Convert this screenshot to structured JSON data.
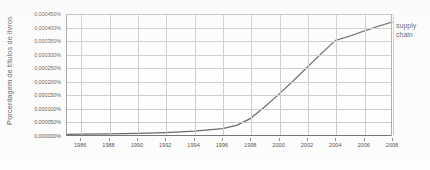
{
  "chart_data": {
    "type": "line",
    "title": "",
    "xlabel": "",
    "ylabel": "Porcentagem de títulos de livros",
    "xlim": [
      1985,
      2008
    ],
    "ylim": [
      0,
      0.00045
    ],
    "grid": true,
    "legend_position": "right-end-of-line",
    "y_tick_labels": [
      "0,000450%",
      "0,000400%",
      "0,000350%",
      "0,000300%",
      "0,000250%",
      "0,000200%",
      "0,000150%",
      "0,000100%",
      "0,000050%",
      "0,000000%"
    ],
    "y_tick_values": [
      0.00045,
      0.0004,
      0.00035,
      0.0003,
      0.00025,
      0.0002,
      0.00015,
      0.0001,
      5e-05,
      0
    ],
    "x_tick_labels": [
      "1986",
      "1988",
      "1990",
      "1992",
      "1994",
      "1996",
      "1998",
      "2000",
      "2002",
      "2004",
      "2006",
      "2008"
    ],
    "x_tick_values": [
      1986,
      1988,
      1990,
      1992,
      1994,
      1996,
      1998,
      2000,
      2002,
      2004,
      2006,
      2008
    ],
    "series": [
      {
        "name": "supply chain",
        "label_lines": [
          "supply",
          "chain"
        ],
        "color": "#4a4a4a",
        "x": [
          1985,
          1986,
          1988,
          1990,
          1992,
          1994,
          1996,
          1997,
          1998,
          1999,
          2000,
          2001,
          2002,
          2003,
          2004,
          2005,
          2006,
          2007,
          2008
        ],
        "values": [
          2e-06,
          3e-06,
          4e-06,
          6e-06,
          9e-06,
          1.4e-05,
          2.4e-05,
          3.6e-05,
          6.2e-05,
          0.000105,
          0.000152,
          0.000201,
          0.000252,
          0.000303,
          0.000352,
          0.000368,
          0.000386,
          0.000404,
          0.00042
        ]
      }
    ]
  },
  "colors": {
    "series_line": "#4a4a4a",
    "gridline": "#c2c2c2",
    "axis": "#5d5d5d",
    "text": "#363636",
    "background": "#ffffff"
  }
}
